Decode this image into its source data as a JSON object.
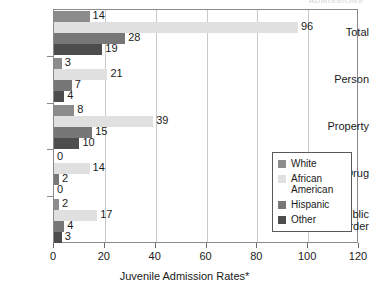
{
  "top_title": "ADMISSIONS",
  "chart_data": {
    "type": "bar",
    "orientation": "horizontal",
    "title": "",
    "xlabel": "Juvenile Admission Rates*",
    "ylabel": "",
    "xlim": [
      0,
      120
    ],
    "xticks": [
      0,
      20,
      40,
      60,
      80,
      100,
      120
    ],
    "xtick_labels": [
      "0",
      "20",
      "40",
      "60",
      "80",
      "100",
      "120"
    ],
    "grid": true,
    "grid_axis": "x",
    "legend_position": "right-inside",
    "categories": [
      "Total",
      "Person",
      "Property",
      "Drug",
      "Public Order"
    ],
    "category_labels": [
      [
        "Total"
      ],
      [
        "Person"
      ],
      [
        "Property"
      ],
      [
        "Drug"
      ],
      [
        "Public",
        "Order"
      ]
    ],
    "series": [
      {
        "name": "White",
        "color": "#8c8c8c",
        "values": [
          14,
          3,
          8,
          0,
          2
        ]
      },
      {
        "name": "African American",
        "color": "#e0e0e0",
        "values": [
          96,
          21,
          39,
          14,
          17
        ]
      },
      {
        "name": "Hispanic",
        "color": "#777777",
        "values": [
          28,
          7,
          15,
          2,
          4
        ]
      },
      {
        "name": "Other",
        "color": "#4d4d4d",
        "values": [
          19,
          4,
          10,
          0,
          3
        ]
      }
    ]
  },
  "legend": {
    "entries": [
      {
        "label": "White",
        "color": "#8c8c8c"
      },
      {
        "label": "African American",
        "color": "#e0e0e0"
      },
      {
        "label": "Hispanic",
        "color": "#777777"
      },
      {
        "label": "Other",
        "color": "#4d4d4d"
      }
    ]
  }
}
